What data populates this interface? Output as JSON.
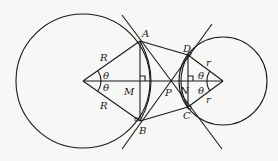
{
  "diagram": {
    "labels": {
      "A": "A",
      "B": "B",
      "C": "C",
      "D": "D",
      "M": "M",
      "N": "N",
      "P": "P",
      "R_upper": "R",
      "R_lower": "R",
      "r_upper": "r",
      "r_lower": "r",
      "theta_left_upper": "θ",
      "theta_left_lower": "θ",
      "theta_right_upper": "θ",
      "theta_right_lower": "θ"
    },
    "colors": {
      "stroke": "#1a1a1a",
      "background": "#f7f7f5"
    }
  }
}
